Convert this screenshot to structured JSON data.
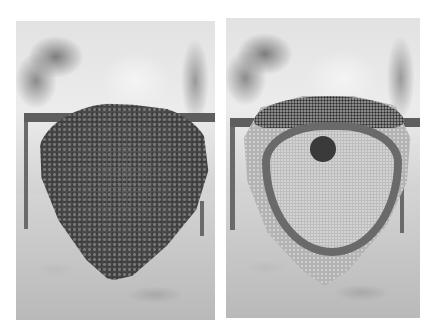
{
  "figure": {
    "panels": [
      {
        "id": "left",
        "subject": "bee swarm covering comb",
        "icon": "bee-swarm-photo"
      },
      {
        "id": "right",
        "subject": "exposed honeycomb with brood area",
        "icon": "honeycomb-photo"
      }
    ]
  },
  "colors": {
    "background": "#ffffff",
    "swarm": "#4a4a4a",
    "comb": "#b3b3b3",
    "bar": "#5e5e5e"
  }
}
